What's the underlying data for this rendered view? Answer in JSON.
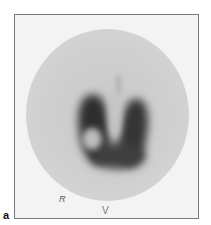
{
  "figure": {
    "panel_label": "a",
    "image_type": "thyroid scintigram",
    "markers": {
      "side_marker": "R",
      "bottom_marker": "V"
    }
  }
}
